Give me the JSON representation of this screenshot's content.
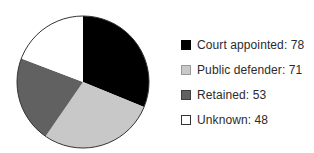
{
  "chart_data": {
    "type": "pie",
    "title": "",
    "categories": [
      "Court appointed",
      "Public defender",
      "Retained",
      "Unknown"
    ],
    "values": [
      78,
      71,
      53,
      48
    ],
    "total": 250,
    "percentages": [
      31.2,
      28.4,
      21.2,
      19.2
    ],
    "slice_colors": [
      "#000000",
      "#c8c8c8",
      "#616161",
      "#ffffff"
    ],
    "start_angle_deg": 0,
    "direction": "clockwise",
    "outline_color": "#333333",
    "legend_position": "right",
    "legend": {
      "items": [
        {
          "text": "Court appointed: 78",
          "swatch_fill": "#000000",
          "swatch_border": "#000000"
        },
        {
          "text": "Public defender: 71",
          "swatch_fill": "#c8c8c8",
          "swatch_border": "#999999"
        },
        {
          "text": "Retained: 53",
          "swatch_fill": "#616161",
          "swatch_border": "#3f3f3f"
        },
        {
          "text": "Unknown: 48",
          "swatch_fill": "#ffffff",
          "swatch_border": "#333333"
        }
      ]
    },
    "geometry": {
      "cx": 83,
      "cy": 82,
      "r": 66
    }
  }
}
